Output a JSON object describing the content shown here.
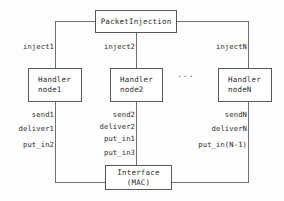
{
  "diagram": {
    "title_box": {
      "text": "PacketInjection"
    },
    "handlers": [
      {
        "line1": "Handler",
        "line2": "node1"
      },
      {
        "line1": "Handler",
        "line2": "node2"
      },
      {
        "line1": "Handler",
        "line2": "nodeN"
      }
    ],
    "ellipsis": "...",
    "interface_box": {
      "line1": "Interface",
      "line2": "(MAC)"
    },
    "inject_labels": [
      {
        "text": "inject1"
      },
      {
        "text": "inject2"
      },
      {
        "text": "injectN"
      }
    ],
    "port_labels_left": [
      {
        "text": "send1"
      },
      {
        "text": "deliver1"
      },
      {
        "text": "put_in2"
      }
    ],
    "port_labels_middle": [
      {
        "text": "send2"
      },
      {
        "text": "deliver2"
      },
      {
        "text": "put_in1"
      },
      {
        "text": "put_in3"
      }
    ],
    "port_labels_right": [
      {
        "text": "sendN"
      },
      {
        "text": "deliverN"
      },
      {
        "text": "put_in(N-1)"
      }
    ],
    "colors": {
      "stroke": "#575757",
      "text": "#2b2b2b",
      "background": "#fdfdfd"
    }
  }
}
